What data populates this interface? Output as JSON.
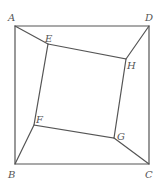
{
  "diagram": {
    "type": "geometry",
    "points": {
      "A": {
        "label": "A",
        "x": 15,
        "y": 26
      },
      "D": {
        "label": "D",
        "x": 149,
        "y": 26
      },
      "B": {
        "label": "B",
        "x": 15,
        "y": 164
      },
      "C": {
        "label": "C",
        "x": 149,
        "y": 164
      },
      "E": {
        "label": "E",
        "x": 48,
        "y": 44
      },
      "H": {
        "label": "H",
        "x": 126,
        "y": 59
      },
      "F": {
        "label": "F",
        "x": 34,
        "y": 125
      },
      "G": {
        "label": "G",
        "x": 114,
        "y": 138
      }
    },
    "outer_square": [
      "A",
      "D",
      "C",
      "B"
    ],
    "inner_quadrilateral": [
      "E",
      "H",
      "G",
      "F"
    ],
    "connectors": [
      [
        "A",
        "E"
      ],
      [
        "D",
        "H"
      ],
      [
        "C",
        "G"
      ],
      [
        "B",
        "F"
      ]
    ],
    "colors": {
      "stroke": "#555555",
      "background": "#ffffff"
    }
  }
}
